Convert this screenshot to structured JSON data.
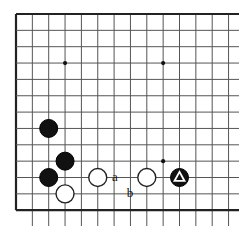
{
  "figure": {
    "kind": "go-board-diagram",
    "background_color": "#ffffff"
  },
  "board": {
    "size": 19,
    "visible_columns": 13,
    "visible_rows": 12,
    "grid_spacing_px": 16.35,
    "origin_x_px": 16,
    "origin_y_px": 14,
    "line_color": "#555555",
    "edge_line_color": "#222222",
    "star_point_color": "#111111",
    "star_points": [
      {
        "col": 3,
        "row": 3
      },
      {
        "col": 9,
        "row": 3
      },
      {
        "col": 9,
        "row": 9
      }
    ]
  },
  "stones": [
    {
      "id": "b1",
      "color": "black",
      "col": 2,
      "row": 7,
      "marked": false
    },
    {
      "id": "b2",
      "color": "black",
      "col": 3,
      "row": 9,
      "marked": false
    },
    {
      "id": "b3",
      "color": "black",
      "col": 2,
      "row": 10,
      "marked": false
    },
    {
      "id": "w1",
      "color": "white",
      "col": 3,
      "row": 11,
      "marked": false
    },
    {
      "id": "w2",
      "color": "white",
      "col": 5,
      "row": 10,
      "marked": false
    },
    {
      "id": "w3",
      "color": "white",
      "col": 8,
      "row": 10,
      "marked": false
    },
    {
      "id": "b4",
      "color": "black",
      "col": 10,
      "row": 10,
      "marked": true,
      "mark": "triangle"
    }
  ],
  "stone_style": {
    "radius_px": 9,
    "black_fill": "#111111",
    "white_fill": "#ffffff",
    "white_stroke": "#222222",
    "black_stroke": "#000000",
    "mark_color": "#ffffff"
  },
  "labels": [
    {
      "id": "label-a",
      "text": "a",
      "x": 115,
      "y": 176
    },
    {
      "id": "label-b",
      "text": "b",
      "x": 130,
      "y": 192
    }
  ]
}
